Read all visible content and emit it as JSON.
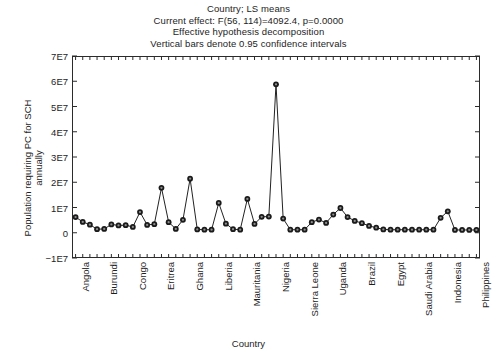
{
  "chart_data": {
    "type": "line",
    "title": "Country; LS means",
    "subtitle_lines": [
      "Country; LS means",
      "Current effect: F(56, 114)=4092.4, p=0.0000",
      "Effective hypothesis decomposition",
      "Vertical bars denote 0.95 confidence intervals"
    ],
    "xlabel": "Country",
    "ylabel": "Population requiring PC for SCH annually",
    "ylabel_lines": [
      "Population requiring PC for SCH",
      "annually"
    ],
    "ylim": [
      -10000000,
      70000000
    ],
    "yticks": [
      70000000,
      60000000,
      50000000,
      40000000,
      30000000,
      20000000,
      10000000,
      0,
      -10000000
    ],
    "ytick_labels": [
      "7E7",
      "6E7",
      "5E7",
      "4E7",
      "3E7",
      "2E7",
      "1E7",
      "0",
      "−1E7"
    ],
    "grid": false,
    "legend": false,
    "marker": "filled-circle",
    "line_color": "#222222",
    "marker_color": "#1a1a1a",
    "n_points": 57,
    "xtick_label_interval": 4,
    "xtick_labels_shown": [
      "Angola",
      "Burundi",
      "Congo",
      "Eritrea",
      "Ghana",
      "Liberia",
      "Mauritania",
      "Nigeria",
      "Sierra Leone",
      "Uganda",
      "Brazil",
      "Egypt",
      "Saudi Arabia",
      "Indonesia",
      "Philippines"
    ],
    "categories": [
      "Angola",
      "Benin",
      "Botswana",
      "Burkina Faso",
      "Burundi",
      "Cameroon",
      "Central African Republic",
      "Chad",
      "Congo",
      "Cote d'Ivoire",
      "DR Congo",
      "Djibouti",
      "Eritrea",
      "Ethiopia",
      "Gabon",
      "Gambia",
      "Ghana",
      "Guinea",
      "Guinea-Bissau",
      "Kenya",
      "Liberia",
      "Madagascar",
      "Malawi",
      "Mali",
      "Mauritania",
      "Mozambique",
      "Namibia",
      "Niger",
      "Nigeria",
      "Rwanda",
      "Senegal",
      "Sao Tome",
      "Sierra Leone",
      "Somalia",
      "South Africa",
      "Sudan",
      "Uganda",
      "Tanzania",
      "Togo",
      "Zambia",
      "Brazil",
      "Venezuela",
      "Suriname",
      "Caribbean",
      "Egypt",
      "Libya",
      "Morocco",
      "Tunisia",
      "Saudi Arabia",
      "Yemen",
      "Iran",
      "Iraq",
      "Indonesia",
      "Cambodia",
      "Laos",
      "Vietnam",
      "Philippines"
    ],
    "values": [
      6200000,
      4300000,
      3200000,
      1400000,
      1500000,
      3300000,
      2900000,
      3000000,
      2300000,
      8200000,
      3100000,
      3400000,
      17800000,
      4200000,
      1500000,
      5100000,
      21400000,
      1300000,
      1200000,
      1200000,
      11800000,
      3600000,
      1400000,
      1200000,
      13400000,
      3500000,
      6300000,
      6400000,
      58800000,
      5600000,
      1200000,
      1200000,
      1200000,
      4200000,
      5200000,
      3900000,
      7200000,
      9800000,
      6200000,
      4700000,
      3800000,
      2700000,
      2000000,
      1300000,
      1200000,
      1200000,
      1200000,
      1200000,
      1200000,
      1200000,
      1200000,
      5900000,
      8500000,
      1100000,
      1100000,
      1100000,
      1100000
    ]
  }
}
